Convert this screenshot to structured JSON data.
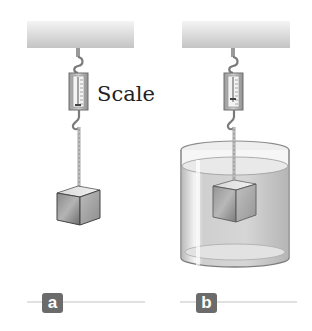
{
  "diagram": {
    "topic": "Spring scale weighing a block in air and submerged in water",
    "labels": {
      "scale": "Scale"
    },
    "panels": [
      {
        "id": "a",
        "marker": "a",
        "description": "Block hanging from scale in air"
      },
      {
        "id": "b",
        "marker": "b",
        "description": "Block hanging from scale submerged in container of water"
      }
    ],
    "colors": {
      "marker_bg": "#6b6b6b",
      "marker_text": "#ffffff",
      "rule_line": "#bdbdbd",
      "ceiling_top": "#f2f2f2",
      "ceiling_bottom": "#c8c8c8",
      "water": "#d6d6d6",
      "block_dark": "#6e6e6e",
      "block_light": "#e6e6e6",
      "label_text": "#222222"
    }
  }
}
